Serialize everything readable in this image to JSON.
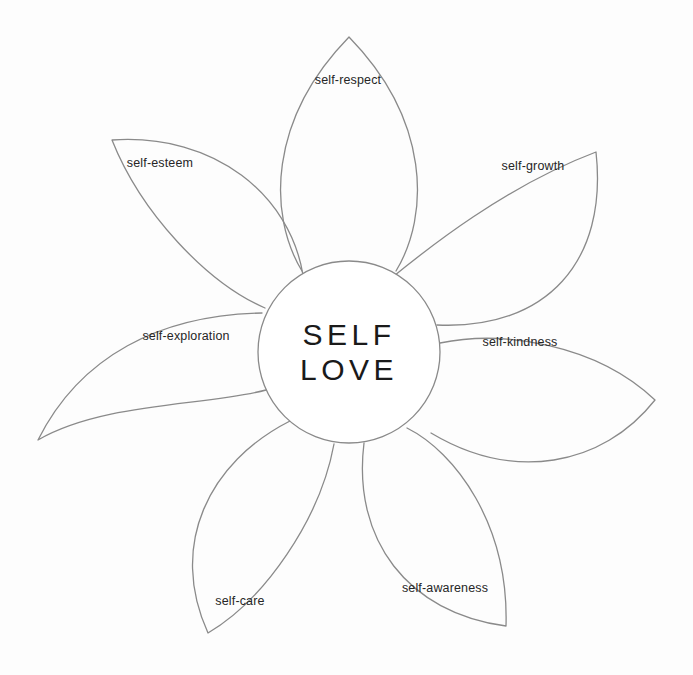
{
  "diagram": {
    "type": "radial-petal-diagram",
    "background_color": "#fdfdfd",
    "stroke_color": "#8a8a8a",
    "text_color": "#262626",
    "core": {
      "line1": "SELF",
      "line2": "LOVE",
      "center_x": 349,
      "center_y": 352,
      "radius": 91
    },
    "petals": [
      {
        "id": "self-respect",
        "label": "self-respect",
        "angle_deg": -90,
        "label_x": 348,
        "label_y": 80,
        "tip_x": 349,
        "tip_y": 37
      },
      {
        "id": "self-growth",
        "label": "self-growth",
        "angle_deg": -38,
        "label_x": 533,
        "label_y": 166,
        "tip_x": 596,
        "tip_y": 152
      },
      {
        "id": "self-kindness",
        "label": "self-kindness",
        "angle_deg": 8,
        "label_x": 520,
        "label_y": 342,
        "tip_x": 655,
        "tip_y": 400
      },
      {
        "id": "self-awareness",
        "label": "self-awareness",
        "angle_deg": 60,
        "label_x": 445,
        "label_y": 588,
        "tip_x": 506,
        "tip_y": 626
      },
      {
        "id": "self-care",
        "label": "self-care",
        "angle_deg": 114,
        "label_x": 240,
        "label_y": 601,
        "tip_x": 208,
        "tip_y": 633
      },
      {
        "id": "self-exploration",
        "label": "self-exploration",
        "angle_deg": 168,
        "label_x": 186,
        "label_y": 336,
        "tip_x": 38,
        "tip_y": 440
      },
      {
        "id": "self-esteem",
        "label": "self-esteem",
        "angle_deg": -142,
        "label_x": 160,
        "label_y": 163,
        "tip_x": 112,
        "tip_y": 140
      }
    ]
  }
}
